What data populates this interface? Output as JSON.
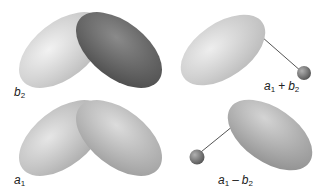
{
  "orbitals": [
    {
      "id": "b2",
      "label": {
        "base": "b",
        "sub": "2"
      },
      "lobes": [
        "light",
        "dark"
      ]
    },
    {
      "id": "a1",
      "label": {
        "base": "a",
        "sub": "1"
      },
      "lobes": [
        "light",
        "light"
      ]
    },
    {
      "id": "a1_plus_b2",
      "label": {
        "t1": "a",
        "s1": "1",
        "op": "+",
        "t2": "b",
        "s2": "2"
      }
    },
    {
      "id": "a1_minus_b2",
      "label": {
        "t1": "a",
        "s1": "1",
        "op": "–",
        "t2": "b",
        "s2": "2"
      }
    }
  ],
  "colors": {
    "light_lobe": "#d9d9d9",
    "dark_lobe": "#6e6e6e",
    "mid_lobe": "#b5b5b5",
    "sphere": "#7a7a7a",
    "line": "#555555"
  }
}
